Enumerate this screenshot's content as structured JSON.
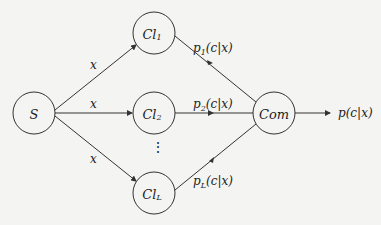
{
  "diagram": {
    "type": "ensemble-classifier-graph",
    "nodes": [
      {
        "id": "S",
        "label": "S",
        "cx": 34,
        "cy": 113
      },
      {
        "id": "Cl1",
        "label": "Cl",
        "sub": "1",
        "cx": 154,
        "cy": 33
      },
      {
        "id": "Cl2",
        "label": "Cl",
        "sub": "2",
        "cx": 154,
        "cy": 113
      },
      {
        "id": "ClL",
        "label": "Cl",
        "sub": "L",
        "cx": 154,
        "cy": 193
      },
      {
        "id": "Com",
        "label": "Com",
        "cx": 274,
        "cy": 113
      }
    ],
    "edges": [
      {
        "from": "S",
        "to": "Cl1",
        "label": "x"
      },
      {
        "from": "S",
        "to": "Cl2",
        "label": "x"
      },
      {
        "from": "S",
        "to": "ClL",
        "label": "x"
      },
      {
        "from": "Cl1",
        "to": "Com",
        "label": "p1(c|x)"
      },
      {
        "from": "Cl2",
        "to": "Com",
        "label": "p2(c|x)"
      },
      {
        "from": "ClL",
        "to": "Com",
        "label": "pL(c|x)"
      },
      {
        "from": "Com",
        "to": "output",
        "label": "p(c|x)"
      }
    ],
    "labels": {
      "s": "S",
      "cl": "Cl",
      "sub1": "1",
      "sub2": "2",
      "subL": "L",
      "com": "Com",
      "x": "x",
      "p1_p": "p",
      "p1_sub": "1",
      "p_rest": "(c|x)",
      "p2_sub": "2",
      "pL_sub": "L",
      "out": "p(c|x)",
      "ellipsis": "⋮"
    },
    "node_radius": 21,
    "stroke_color": "#333333",
    "background": "#f4f4f2"
  }
}
